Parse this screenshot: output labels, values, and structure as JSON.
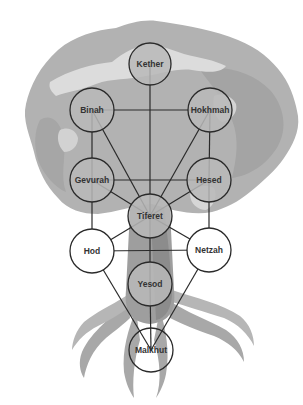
{
  "diagram": {
    "colors": {
      "background": "#ffffff",
      "canopy": "#b4b4b4",
      "canopy_dark": "#a3a3a3",
      "canopy_highlight": "#d8d8d8",
      "trunk": "#9a9a9a",
      "trunk_light": "#bdbdbd",
      "line": "#2a2a2a",
      "node_shaded": "#b8b8b8",
      "node_white": "#ffffff"
    },
    "nodes": [
      {
        "id": "kether",
        "label": "Kether",
        "cx": 150,
        "cy": 64,
        "r": 21,
        "fill": "shaded"
      },
      {
        "id": "binah",
        "label": "Binah",
        "cx": 92,
        "cy": 110,
        "r": 22,
        "fill": "shaded"
      },
      {
        "id": "hokhmah",
        "label": "Hokhmah",
        "cx": 210,
        "cy": 110,
        "r": 22,
        "fill": "shaded"
      },
      {
        "id": "gevurah",
        "label": "Gevurah",
        "cx": 92,
        "cy": 180,
        "r": 22,
        "fill": "shaded"
      },
      {
        "id": "hesed",
        "label": "Hesed",
        "cx": 209,
        "cy": 180,
        "r": 22,
        "fill": "shaded"
      },
      {
        "id": "tiferet",
        "label": "Tiferet",
        "cx": 150,
        "cy": 216,
        "r": 22,
        "fill": "shaded"
      },
      {
        "id": "hod",
        "label": "Hod",
        "cx": 92,
        "cy": 251,
        "r": 22,
        "fill": "white"
      },
      {
        "id": "netzah",
        "label": "Netzah",
        "cx": 209,
        "cy": 250,
        "r": 22,
        "fill": "white"
      },
      {
        "id": "yesod",
        "label": "Yesod",
        "cx": 150,
        "cy": 284,
        "r": 22,
        "fill": "shaded"
      },
      {
        "id": "malkhut",
        "label": "Malkhut",
        "cx": 151,
        "cy": 350,
        "r": 22,
        "fill": "transparent"
      }
    ],
    "edges": [
      [
        "kether",
        "tiferet"
      ],
      [
        "binah",
        "hokhmah"
      ],
      [
        "binah",
        "gevurah"
      ],
      [
        "binah",
        "tiferet"
      ],
      [
        "hokhmah",
        "hesed"
      ],
      [
        "hokhmah",
        "tiferet"
      ],
      [
        "gevurah",
        "hesed"
      ],
      [
        "gevurah",
        "tiferet"
      ],
      [
        "gevurah",
        "hod"
      ],
      [
        "hesed",
        "tiferet"
      ],
      [
        "hesed",
        "netzah"
      ],
      [
        "tiferet",
        "hod"
      ],
      [
        "tiferet",
        "netzah"
      ],
      [
        "tiferet",
        "yesod"
      ],
      [
        "hod",
        "netzah"
      ],
      [
        "hod",
        "malkhut"
      ],
      [
        "netzah",
        "malkhut"
      ],
      [
        "yesod",
        "malkhut"
      ]
    ]
  },
  "labels": {
    "kether": "Kether",
    "binah": "Binah",
    "hokhmah": "Hokhmah",
    "gevurah": "Gevurah",
    "hesed": "Hesed",
    "tiferet": "Tiferet",
    "hod": "Hod",
    "netzah": "Netzah",
    "yesod": "Yesod",
    "malkhut": "Malkhut"
  }
}
